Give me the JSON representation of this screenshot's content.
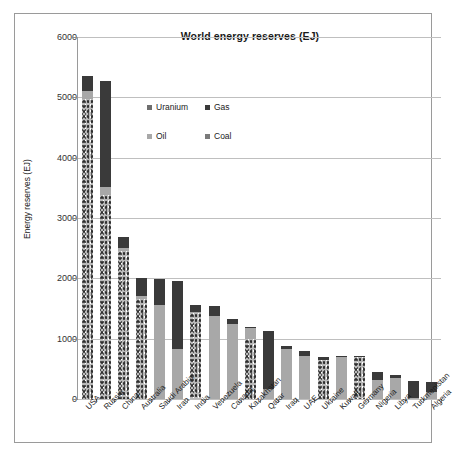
{
  "chart_data": {
    "type": "bar",
    "subtype": "stacked-column",
    "title": "World energy reserves (EJ)",
    "xlabel": "",
    "ylabel": "Energy reserves (EJ)",
    "ylim": [
      0,
      6000
    ],
    "ytick_step": 1000,
    "yticks": [
      "0",
      "1000",
      "2000",
      "3000",
      "4000",
      "5000",
      "6000"
    ],
    "grid": "horizontal",
    "legend_position": "inside-top-center",
    "legend": [
      "Uranium",
      "Gas",
      "Oil",
      "Coal"
    ],
    "categories": [
      "USA",
      "Russia",
      "China",
      "Australia",
      "Saudi Arabia",
      "Iran",
      "India",
      "Venezuela",
      "Canada",
      "Kazakhstan",
      "Qatar",
      "Iraq",
      "UAE",
      "Ukraine",
      "Kuwait",
      "Germany",
      "Nigeria",
      "Libya",
      "Turkmenistan",
      "Algeria"
    ],
    "series": [
      {
        "name": "Coal",
        "color": "#b9b9b9",
        "values": [
          4980,
          3380,
          2450,
          1650,
          0,
          0,
          1430,
          0,
          0,
          990,
          0,
          0,
          0,
          640,
          0,
          700,
          0,
          0,
          0,
          0
        ]
      },
      {
        "name": "Oil",
        "color": "#a8a8a8",
        "values": [
          120,
          130,
          60,
          60,
          1560,
          830,
          20,
          1380,
          1240,
          180,
          170,
          830,
          720,
          10,
          690,
          0,
          310,
          350,
          10,
          110
        ]
      },
      {
        "name": "Gas",
        "color": "#3a3a3a",
        "values": [
          250,
          1760,
          170,
          290,
          430,
          1120,
          110,
          170,
          80,
          30,
          950,
          50,
          70,
          50,
          30,
          10,
          140,
          50,
          290,
          170
        ]
      },
      {
        "name": "Uranium",
        "color": "#6e6e6e",
        "values": [
          0,
          0,
          0,
          0,
          0,
          0,
          0,
          0,
          0,
          0,
          0,
          0,
          0,
          0,
          0,
          0,
          0,
          0,
          0,
          0
        ]
      }
    ],
    "totals": [
      5350,
      5270,
      2680,
      2000,
      1990,
      1950,
      1560,
      1550,
      1320,
      1200,
      1120,
      880,
      790,
      700,
      720,
      710,
      450,
      400,
      300,
      280
    ]
  }
}
